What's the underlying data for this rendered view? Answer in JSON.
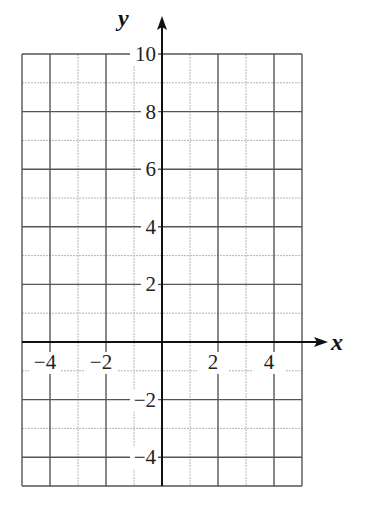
{
  "chart_data": {
    "type": "scatter",
    "title": "",
    "xlabel": "x",
    "ylabel": "y",
    "xlim": [
      -5,
      5
    ],
    "ylim": [
      -5,
      10
    ],
    "grid": true,
    "grid_major_step": 2,
    "grid_minor_step": 1,
    "x_ticks": [
      -4,
      -2,
      2,
      4
    ],
    "x_tick_labels": [
      "−4",
      "−2",
      "2",
      "4"
    ],
    "y_ticks": [
      10,
      8,
      6,
      4,
      2,
      -2,
      -4
    ],
    "y_tick_labels": [
      "10",
      "8",
      "6",
      "4",
      "2",
      "−2",
      "−4"
    ],
    "series": [],
    "colors": {
      "major_grid": "#555555",
      "minor_grid": "#b5b5b5",
      "axis": "#111111"
    }
  }
}
